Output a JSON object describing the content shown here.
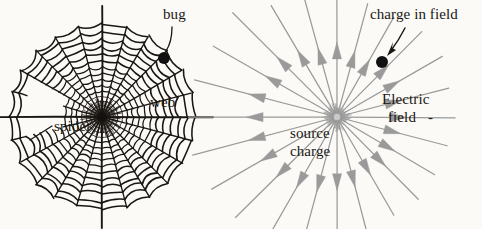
{
  "figure": {
    "background_color": "#fbfaf7",
    "width": 482,
    "height": 229,
    "ink_color": "#1a1713",
    "field_color": "#9a9a9a"
  },
  "left_diagram": {
    "name": "spider-web-diagram",
    "center": {
      "x": 102,
      "y": 117
    },
    "outer_radius": 93,
    "ring_count": 15,
    "spoke_count": 24,
    "labels": {
      "bug": "bug",
      "web": "web",
      "spider": "spider"
    },
    "bug_dot": {
      "x": 164,
      "y": 58,
      "r": 6,
      "color": "#111111"
    }
  },
  "right_diagram": {
    "name": "electric-field-diagram",
    "center": {
      "x": 337,
      "y": 117
    },
    "ray_count": 24,
    "ray_length": 118,
    "arrow_direction": "outward",
    "labels": {
      "charge_in_field": "charge in field",
      "electric": "Electric",
      "field": "field",
      "field_dash": "-",
      "source": "source",
      "charge": "charge"
    },
    "charge_dot": {
      "x": 382,
      "y": 62,
      "r": 6,
      "color": "#111111"
    }
  }
}
